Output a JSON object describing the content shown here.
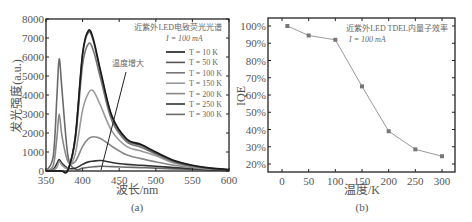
{
  "figure": {
    "panel_a": {
      "label": "(a)",
      "title_line1": "近紫外LED电致荧光光谱",
      "title_line2": "I = 100 mA",
      "xlabel": "波长/nm",
      "ylabel": "发光强度(a.u.)",
      "arrow_label": "温度增大",
      "xticks": [
        "350",
        "400",
        "450",
        "500",
        "550",
        "600"
      ],
      "yticks": [
        "0",
        "1000",
        "2000",
        "3000",
        "4000",
        "5000",
        "6000",
        "7000",
        "8000"
      ],
      "legend": [
        {
          "label": "T = 10 K",
          "color": "#1a1a1a"
        },
        {
          "label": "T = 50 K",
          "color": "#555555"
        },
        {
          "label": "T = 100 K",
          "color": "#777777"
        },
        {
          "label": "T = 150 K",
          "color": "#9a9a9a"
        },
        {
          "label": "T = 200 K",
          "color": "#888888"
        },
        {
          "label": "T = 250 K",
          "color": "#333333"
        },
        {
          "label": "T = 300 K",
          "color": "#6a6a6a"
        }
      ]
    },
    "panel_b": {
      "label": "(b)",
      "title_line1": "近紫外LED TDEL内量子效率",
      "title_line2": "I = 100 mA",
      "xlabel": "温度/K",
      "ylabel": "IQE",
      "xticks": [
        "0",
        "50",
        "100",
        "150",
        "200",
        "250",
        "300"
      ],
      "yticks": [
        "20%",
        "30%",
        "40%",
        "50%",
        "60%",
        "70%",
        "80%",
        "90%",
        "100%"
      ]
    }
  },
  "chart_data": [
    {
      "type": "line",
      "title": "近紫外LED电致荧光光谱 I = 100 mA",
      "xlabel": "波长/nm",
      "ylabel": "发光强度(a.u.)",
      "xlim": [
        350,
        600
      ],
      "ylim": [
        0,
        8000
      ],
      "legend_position": "upper right",
      "annotation": "温度增大 (arrow pointing toward decreasing main peak)",
      "x": [
        350,
        360,
        365,
        368,
        372,
        380,
        390,
        400,
        408,
        415,
        425,
        440,
        460,
        480,
        500,
        525,
        550,
        575,
        600
      ],
      "series": [
        {
          "name": "T = 10 K",
          "values": [
            0,
            0,
            0,
            0,
            0,
            50,
            1800,
            6200,
            7400,
            6900,
            5200,
            2900,
            1700,
            1400,
            1000,
            550,
            300,
            150,
            80
          ]
        },
        {
          "name": "T = 50 K",
          "values": [
            0,
            0,
            0,
            0,
            0,
            50,
            1750,
            6100,
            7300,
            6800,
            5100,
            2850,
            1650,
            1350,
            950,
            520,
            280,
            140,
            70
          ]
        },
        {
          "name": "T = 100 K",
          "values": [
            0,
            0,
            0,
            0,
            0,
            60,
            1600,
            5600,
            6700,
            6300,
            4800,
            2650,
            1550,
            1250,
            900,
            480,
            260,
            130,
            60
          ]
        },
        {
          "name": "T = 150 K",
          "values": [
            0,
            50,
            200,
            500,
            300,
            150,
            900,
            3200,
            4100,
            4200,
            3400,
            2100,
            1300,
            1050,
            800,
            420,
            230,
            110,
            50
          ]
        },
        {
          "name": "T = 200 K",
          "values": [
            0,
            300,
            1800,
            3000,
            1800,
            500,
            500,
            1300,
            1700,
            1800,
            1700,
            1300,
            850,
            650,
            480,
            300,
            180,
            90,
            40
          ]
        },
        {
          "name": "T = 250 K",
          "values": [
            0,
            100,
            400,
            600,
            400,
            150,
            150,
            350,
            480,
            520,
            550,
            450,
            350,
            300,
            250,
            180,
            120,
            70,
            30
          ]
        },
        {
          "name": "T = 300 K",
          "values": [
            0,
            800,
            4000,
            5900,
            4200,
            800,
            100,
            150,
            200,
            220,
            250,
            230,
            200,
            180,
            150,
            110,
            80,
            50,
            20
          ]
        }
      ]
    },
    {
      "type": "line",
      "title": "近紫外LED TDEL内量子效率 I = 100 mA",
      "xlabel": "温度/K",
      "ylabel": "IQE",
      "xlim": [
        -25,
        325
      ],
      "ylim": [
        15,
        105
      ],
      "x": [
        10,
        50,
        100,
        150,
        200,
        250,
        300
      ],
      "series": [
        {
          "name": "IQE",
          "values": [
            100,
            94.5,
            92,
            65,
            39,
            28.5,
            24.5
          ]
        }
      ]
    }
  ]
}
